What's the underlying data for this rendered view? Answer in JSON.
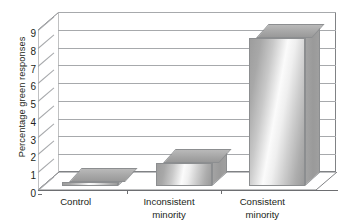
{
  "chart_data": {
    "type": "bar",
    "title": "",
    "xlabel": "",
    "ylabel": "Percentage green responses",
    "categories": [
      "Control",
      "Inconsistent\nminority",
      "Consistent\nminority"
    ],
    "category_lines": [
      [
        "Control"
      ],
      [
        "Inconsistent",
        "minority"
      ],
      [
        "Consistent",
        "minority"
      ]
    ],
    "values": [
      0.2,
      1.3,
      8.3
    ],
    "ylim": [
      0,
      9
    ],
    "ytick_labels": [
      "0",
      "1",
      "2",
      "3",
      "4",
      "5",
      "6",
      "7",
      "8",
      "9"
    ],
    "ytick_values": [
      0,
      1,
      2,
      3,
      4,
      5,
      6,
      7,
      8,
      9
    ],
    "grid": true,
    "legend": "none",
    "style": "3d-bar",
    "colors": {
      "bar_light": "#fbfbfb",
      "bar_mid": "#c9c9c9",
      "bar_dark": "#9a9a9a",
      "bar_outline": "#8c8e90",
      "gridline": "#a7a9ac",
      "axis": "#6d6e71",
      "frame": "#808285",
      "text": "#231f20",
      "background": "#ffffff"
    }
  }
}
